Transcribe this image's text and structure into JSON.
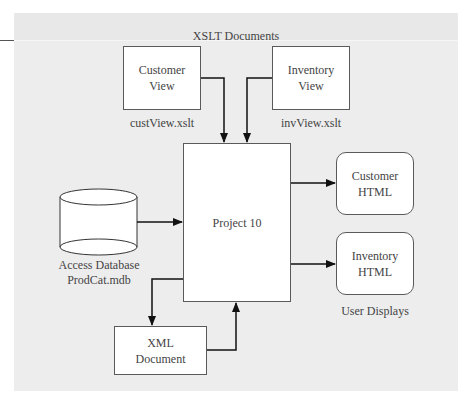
{
  "diagram": {
    "group_title": "XSLT Documents",
    "customer_view": {
      "line1": "Customer",
      "line2": "View",
      "filename": "custView.xslt"
    },
    "inventory_view": {
      "line1": "Inventory",
      "line2": "View",
      "filename": "invView.xslt"
    },
    "project": {
      "label": "Project 10"
    },
    "database": {
      "line1": "Access Database",
      "line2": "ProdCat.mdb",
      "icon": "database-cylinder-icon"
    },
    "customer_html": {
      "line1": "Customer",
      "line2": "HTML"
    },
    "inventory_html": {
      "line1": "Inventory",
      "line2": "HTML"
    },
    "outputs_label": "User Displays",
    "xml_doc": {
      "line1": "XML",
      "line2": "Document"
    },
    "colors": {
      "panel": "#ededed",
      "box_fill": "#ffffff",
      "stroke": "#222222",
      "text": "#444444"
    }
  }
}
